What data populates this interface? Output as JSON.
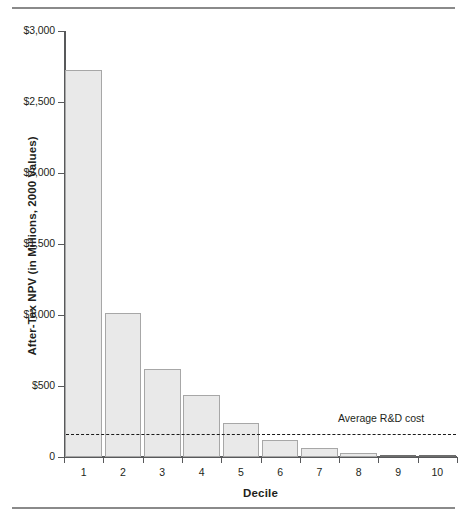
{
  "figure": {
    "has_top_rule": true,
    "has_bottom_rule": true
  },
  "chart_data": {
    "type": "bar",
    "title": "",
    "subtitle": "",
    "xlabel": "Decile",
    "ylabel": "After-Tax NPV (in Millions, 2000 Values)",
    "categories": [
      "1",
      "2",
      "3",
      "4",
      "5",
      "6",
      "7",
      "8",
      "9",
      "10"
    ],
    "values": [
      2725,
      1015,
      620,
      437,
      240,
      120,
      63,
      28,
      5,
      2
    ],
    "ylim": [
      0,
      3000
    ],
    "yticks": [
      0,
      500,
      1000,
      1500,
      2000,
      2500,
      3000
    ],
    "ytick_labels": [
      "0",
      "$500",
      "$1,000",
      "$1,500",
      "$2,000",
      "$2,500",
      "$3,000"
    ],
    "grid": false,
    "legend": "none",
    "annotations": [
      {
        "name": "average-rd-cost",
        "text": "Average R&D cost",
        "type": "horizontal-reference-line",
        "value": 162,
        "line_style": "dashed"
      }
    ],
    "colors": {
      "bar_fill": "#e9e9e9",
      "bar_stroke": "#a7a7a7",
      "axis": "#58595b",
      "reference_line": "#1a1a1a",
      "text": "#231f20",
      "rule": "#8a8a8a"
    }
  }
}
